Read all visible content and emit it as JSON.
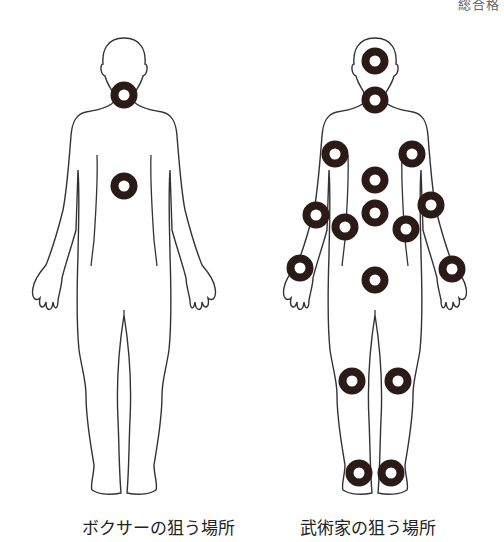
{
  "header": {
    "corner_text": "総合格"
  },
  "figures": [
    {
      "id": "boxer",
      "caption": "ボクサーの狙う場所",
      "targets": [
        {
          "name": "neck",
          "cx": 124,
          "cy": 95
        },
        {
          "name": "solar-plexus",
          "cx": 124,
          "cy": 186
        }
      ]
    },
    {
      "id": "martial-artist",
      "caption": "武術家の狙う場所",
      "targets": [
        {
          "name": "head",
          "cx": 375,
          "cy": 61
        },
        {
          "name": "neck",
          "cx": 375,
          "cy": 100
        },
        {
          "name": "right-shoulder",
          "cx": 335,
          "cy": 154
        },
        {
          "name": "left-shoulder",
          "cx": 412,
          "cy": 154
        },
        {
          "name": "chest",
          "cx": 375,
          "cy": 180
        },
        {
          "name": "abdomen",
          "cx": 375,
          "cy": 213
        },
        {
          "name": "right-elbow",
          "cx": 316,
          "cy": 215
        },
        {
          "name": "left-elbow",
          "cx": 431,
          "cy": 205
        },
        {
          "name": "right-flank",
          "cx": 345,
          "cy": 227
        },
        {
          "name": "left-flank",
          "cx": 406,
          "cy": 229
        },
        {
          "name": "right-wrist",
          "cx": 300,
          "cy": 268
        },
        {
          "name": "left-wrist",
          "cx": 452,
          "cy": 269
        },
        {
          "name": "groin",
          "cx": 375,
          "cy": 280
        },
        {
          "name": "right-knee",
          "cx": 352,
          "cy": 381
        },
        {
          "name": "left-knee",
          "cx": 398,
          "cy": 381
        },
        {
          "name": "right-ankle",
          "cx": 359,
          "cy": 473
        },
        {
          "name": "left-ankle",
          "cx": 391,
          "cy": 473
        }
      ]
    }
  ],
  "colors": {
    "ring": "#2a1a18",
    "outline": "#333333"
  }
}
